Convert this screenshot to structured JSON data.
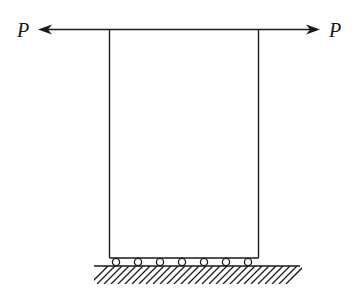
{
  "diagram": {
    "left_force": {
      "label": "P",
      "direction": "left"
    },
    "right_force": {
      "label": "P",
      "direction": "right"
    },
    "block": {
      "shape": "rectangle"
    },
    "supports": {
      "type": "rollers",
      "count": 7
    },
    "ground": {
      "style": "hatched"
    },
    "colors": {
      "line": "#1a1a1a",
      "background": "#ffffff"
    }
  }
}
